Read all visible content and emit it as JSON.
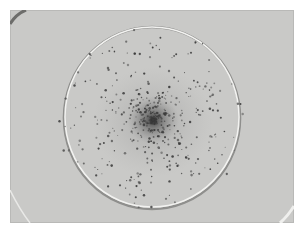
{
  "image": {
    "description": "Grayscale photograph of a circular well/dish with dark particles concentrated in a dense central cluster and scattered outward",
    "background_color": "#ffffff",
    "photo_color": "#c9c9c7",
    "ring_color": "#efefed",
    "particle_color": "#3a3a3a"
  }
}
